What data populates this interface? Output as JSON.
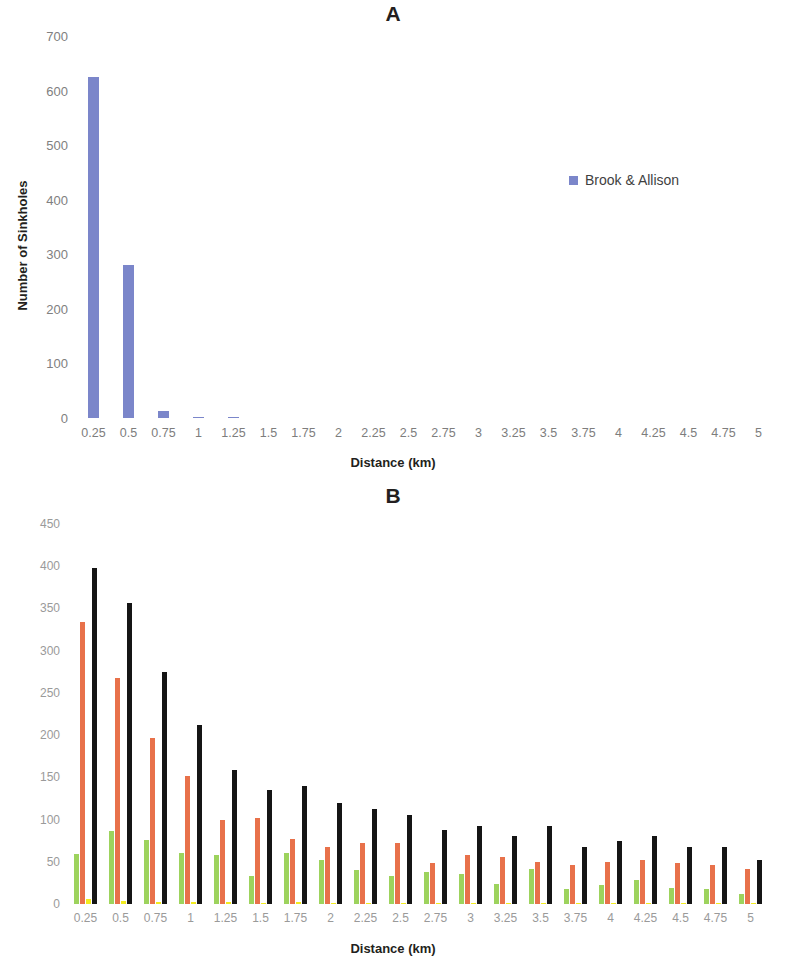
{
  "figure": {
    "panel_a_letter": "A",
    "panel_b_letter": "B"
  },
  "colors": {
    "brook_allison": "#7b86ca",
    "vernon": "#9dd35d",
    "fdot": "#e8714a",
    "corps": "#f2ec1f",
    "combined": "#151515",
    "axis_text": "#808080",
    "title_text": "#231f20"
  },
  "panel_a": {
    "letter": "A",
    "xlabel": "Distance (km)",
    "ylabel": "Number of Sinkholes",
    "legend": [
      {
        "label": "Brook & Allison",
        "color": "#7b86ca"
      }
    ],
    "yticks": [
      "700",
      "600",
      "500",
      "400",
      "300",
      "200",
      "100",
      "0"
    ]
  },
  "panel_b": {
    "letter": "B",
    "xlabel": "Distance (km)",
    "ylabel": "Number of Sinkholes",
    "legend": [
      {
        "label": "Vernon",
        "color": "#9dd35d"
      },
      {
        "label": "FDOT",
        "color": "#e8714a"
      },
      {
        "label": "Corps",
        "color": "#f2ec1f"
      },
      {
        "label": "combined",
        "color": "#151515"
      }
    ],
    "yticks": [
      "450",
      "400",
      "350",
      "300",
      "250",
      "200",
      "150",
      "100",
      "50",
      "0"
    ]
  },
  "chart_data": [
    {
      "type": "bar",
      "title": "A",
      "xlabel": "Distance (km)",
      "ylabel": "Number of Sinkholes",
      "ylim": [
        0,
        700
      ],
      "ytick_step": 100,
      "grid": false,
      "legend_position": "right",
      "categories": [
        "0.25",
        "0.5",
        "0.75",
        "1",
        "1.25",
        "1.5",
        "1.75",
        "2",
        "2.25",
        "2.5",
        "2.75",
        "3",
        "3.25",
        "3.5",
        "3.75",
        "4",
        "4.25",
        "4.5",
        "4.75",
        "5"
      ],
      "series": [
        {
          "name": "Brook & Allison",
          "color": "#7b86ca",
          "values": [
            625,
            281,
            13,
            2,
            2,
            0,
            0,
            0,
            0,
            0,
            0,
            0,
            0,
            0,
            0,
            0,
            0,
            0,
            0,
            0
          ]
        }
      ]
    },
    {
      "type": "bar",
      "title": "B",
      "xlabel": "Distance (km)",
      "ylabel": "Number of Sinkholes",
      "ylim": [
        0,
        450
      ],
      "ytick_step": 50,
      "grid": false,
      "legend_position": "right",
      "categories": [
        "0.25",
        "0.5",
        "0.75",
        "1",
        "1.25",
        "1.5",
        "1.75",
        "2",
        "2.25",
        "2.5",
        "2.75",
        "3",
        "3.25",
        "3.5",
        "3.75",
        "4",
        "4.25",
        "4.5",
        "4.75",
        "5"
      ],
      "series": [
        {
          "name": "Vernon",
          "color": "#9dd35d",
          "values": [
            59,
            86,
            76,
            60,
            58,
            33,
            61,
            52,
            40,
            33,
            38,
            35,
            24,
            41,
            18,
            23,
            28,
            19,
            18,
            12
          ]
        },
        {
          "name": "FDOT",
          "color": "#e8714a",
          "values": [
            334,
            268,
            197,
            152,
            99,
            102,
            77,
            68,
            72,
            72,
            49,
            58,
            56,
            50,
            46,
            50,
            52,
            49,
            46,
            41
          ]
        },
        {
          "name": "Corps",
          "color": "#f2ec1f",
          "values": [
            6,
            3,
            2,
            2,
            2,
            1,
            2,
            1,
            1,
            1,
            1,
            1,
            1,
            1,
            1,
            1,
            1,
            1,
            1,
            1
          ]
        },
        {
          "name": "combined",
          "color": "#151515",
          "values": [
            398,
            356,
            275,
            212,
            159,
            135,
            140,
            120,
            112,
            105,
            88,
            92,
            80,
            92,
            67,
            75,
            80,
            67,
            68,
            52
          ]
        }
      ]
    }
  ]
}
